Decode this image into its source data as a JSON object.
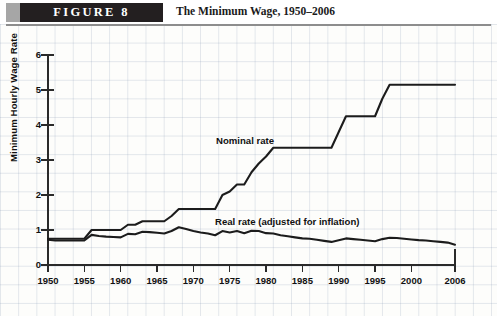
{
  "header": {
    "figure_badge": "FIGURE  8",
    "title": "The Minimum Wage, 1950–2006"
  },
  "source": {
    "text": "SOURCES: U.S. Department of Labor, Employment Standards Administration, http://www.dol.gov, and Bureau of Labor Statistics, http://www.bls.gov."
  },
  "chart_data": {
    "type": "line",
    "title": "The Minimum Wage, 1950–2006",
    "xlabel": "",
    "ylabel": "Minimum Hourly Wage Rate",
    "xlim": [
      1950,
      2006
    ],
    "ylim": [
      0,
      6
    ],
    "yticks": [
      0,
      1,
      2,
      3,
      4,
      5,
      6
    ],
    "xticks": [
      1950,
      1955,
      1960,
      1965,
      1970,
      1975,
      1980,
      1985,
      1990,
      1995,
      2000,
      2006
    ],
    "grid": true,
    "legend_position": "inline-annotations",
    "annotations": [
      {
        "text": "Nominal rate",
        "x": 1977,
        "y": 3.9
      },
      {
        "text": "Real rate (adjusted for inflation)",
        "x": 1977,
        "y": 1.55
      }
    ],
    "x": [
      1950,
      1951,
      1952,
      1953,
      1954,
      1955,
      1956,
      1957,
      1958,
      1959,
      1960,
      1961,
      1962,
      1963,
      1964,
      1965,
      1966,
      1967,
      1968,
      1969,
      1970,
      1971,
      1972,
      1973,
      1974,
      1975,
      1976,
      1977,
      1978,
      1979,
      1980,
      1981,
      1982,
      1983,
      1984,
      1985,
      1986,
      1987,
      1988,
      1989,
      1990,
      1991,
      1992,
      1993,
      1994,
      1995,
      1996,
      1997,
      1998,
      1999,
      2000,
      2001,
      2002,
      2003,
      2004,
      2005,
      2006
    ],
    "series": [
      {
        "name": "Nominal rate",
        "values": [
          0.75,
          0.75,
          0.75,
          0.75,
          0.75,
          0.75,
          1.0,
          1.0,
          1.0,
          1.0,
          1.0,
          1.15,
          1.15,
          1.25,
          1.25,
          1.25,
          1.25,
          1.4,
          1.6,
          1.6,
          1.6,
          1.6,
          1.6,
          1.6,
          2.0,
          2.1,
          2.3,
          2.3,
          2.65,
          2.9,
          3.1,
          3.35,
          3.35,
          3.35,
          3.35,
          3.35,
          3.35,
          3.35,
          3.35,
          3.35,
          3.8,
          4.25,
          4.25,
          4.25,
          4.25,
          4.25,
          4.75,
          5.15,
          5.15,
          5.15,
          5.15,
          5.15,
          5.15,
          5.15,
          5.15,
          5.15,
          5.15
        ]
      },
      {
        "name": "Real rate (adjusted for inflation)",
        "values": [
          0.72,
          0.7,
          0.7,
          0.7,
          0.7,
          0.7,
          0.86,
          0.83,
          0.81,
          0.8,
          0.79,
          0.89,
          0.88,
          0.95,
          0.94,
          0.92,
          0.9,
          0.97,
          1.08,
          1.03,
          0.97,
          0.93,
          0.9,
          0.85,
          0.97,
          0.93,
          0.97,
          0.91,
          0.98,
          0.97,
          0.91,
          0.9,
          0.85,
          0.82,
          0.79,
          0.76,
          0.75,
          0.72,
          0.69,
          0.66,
          0.71,
          0.76,
          0.74,
          0.72,
          0.7,
          0.68,
          0.74,
          0.78,
          0.77,
          0.75,
          0.73,
          0.71,
          0.7,
          0.68,
          0.66,
          0.64,
          0.58
        ]
      }
    ]
  }
}
